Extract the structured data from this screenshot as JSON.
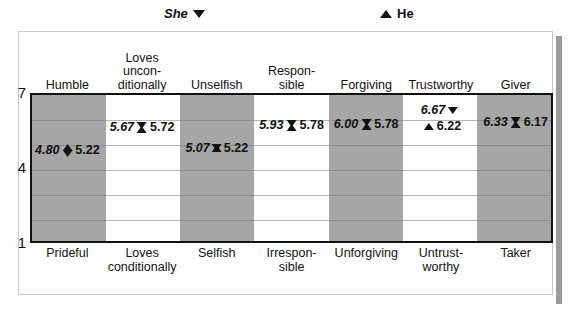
{
  "legend": {
    "she": {
      "label": "She",
      "marker": "triangle-down-icon"
    },
    "he": {
      "label": "He",
      "marker": "triangle-up-icon"
    }
  },
  "chart_data": {
    "type": "scatter",
    "title": "",
    "xlabel": "",
    "ylabel": "",
    "ylim": [
      1,
      7
    ],
    "yticks": [
      "1",
      "4",
      "7"
    ],
    "grid": true,
    "legend_position": "top",
    "categories": [
      "Humble",
      "Loves unconditionally",
      "Unselfish",
      "Responsible",
      "Forgiving",
      "Trustworthy",
      "Giver"
    ],
    "categories_top": [
      [
        "Humble"
      ],
      [
        "Loves",
        "uncon-",
        "ditionally"
      ],
      [
        "Unselfish"
      ],
      [
        "Respon-",
        "sible"
      ],
      [
        "Forgiving"
      ],
      [
        "Trustworthy"
      ],
      [
        "Giver"
      ]
    ],
    "categories_bottom": [
      [
        "Prideful"
      ],
      [
        "Loves",
        "conditionally"
      ],
      [
        "Selfish"
      ],
      [
        "Irrespon-",
        "sible"
      ],
      [
        "Unforgiving"
      ],
      [
        "Untrust-",
        "worthy"
      ],
      [
        "Taker"
      ]
    ],
    "series": [
      {
        "name": "She",
        "values": [
          4.8,
          5.67,
          5.07,
          5.93,
          6.0,
          6.67,
          6.33
        ]
      },
      {
        "name": "He",
        "values": [
          5.22,
          5.72,
          5.22,
          5.78,
          5.78,
          6.22,
          6.17
        ]
      }
    ],
    "point_labels": [
      {
        "she": "4.80",
        "he": "5.22"
      },
      {
        "she": "5.67",
        "he": "5.72"
      },
      {
        "she": "5.07",
        "he": "5.22"
      },
      {
        "she": "5.93",
        "he": "5.78"
      },
      {
        "she": "6.00",
        "he": "5.78"
      },
      {
        "she": "6.67",
        "he": "6.22"
      },
      {
        "she": "6.33",
        "he": "6.17"
      }
    ],
    "band_colors": [
      "#a6a6a6",
      "#ffffff"
    ],
    "marker_color": "#111111"
  }
}
